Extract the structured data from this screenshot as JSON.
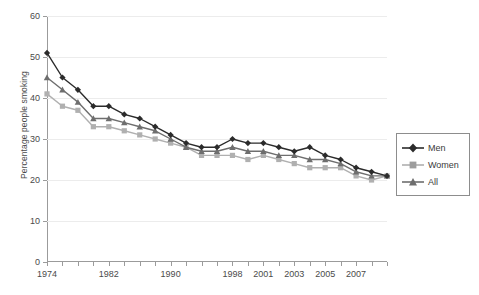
{
  "chart_data": {
    "type": "line",
    "title": "",
    "xlabel": "",
    "ylabel": "Percentage people smoking",
    "ylim": [
      0,
      60
    ],
    "ytick_step": 10,
    "yticks": [
      0,
      10,
      20,
      30,
      40,
      50,
      60
    ],
    "grid": true,
    "legend_position": "right",
    "x": [
      1974,
      1976,
      1978,
      1980,
      1982,
      1984,
      1986,
      1988,
      1990,
      1992,
      1994,
      1996,
      1998,
      2000,
      2001,
      2002,
      2003,
      2004,
      2005,
      2006,
      2007,
      2008,
      2009
    ],
    "xtick_labels": [
      "1974",
      "",
      "",
      "",
      "1982",
      "",
      "",
      "",
      "1990",
      "",
      "",
      "",
      "1998",
      "",
      "2001",
      "",
      "2003",
      "",
      "2005",
      "",
      "2007",
      "",
      ""
    ],
    "series": [
      {
        "name": "Men",
        "color": "#2b2b2b",
        "marker": "diamond",
        "values": [
          51,
          45,
          42,
          38,
          38,
          36,
          35,
          33,
          31,
          29,
          28,
          28,
          30,
          29,
          29,
          28,
          27,
          28,
          26,
          25,
          23,
          22,
          21
        ]
      },
      {
        "name": "Women",
        "color": "#b0b0b0",
        "marker": "square",
        "values": [
          41,
          38,
          37,
          33,
          33,
          32,
          31,
          30,
          29,
          28,
          26,
          26,
          26,
          25,
          26,
          25,
          24,
          23,
          23,
          23,
          21,
          20,
          21
        ]
      },
      {
        "name": "All",
        "color": "#6e6e6e",
        "marker": "triangle",
        "values": [
          45,
          42,
          39,
          35,
          35,
          34,
          33,
          32,
          30,
          28,
          27,
          27,
          28,
          27,
          27,
          26,
          26,
          25,
          25,
          24,
          22,
          21,
          21
        ]
      }
    ]
  },
  "legend": {
    "items": [
      {
        "label": "Men"
      },
      {
        "label": "Women"
      },
      {
        "label": "All"
      }
    ]
  },
  "axes": {
    "y_title": "Percentage people smoking"
  }
}
